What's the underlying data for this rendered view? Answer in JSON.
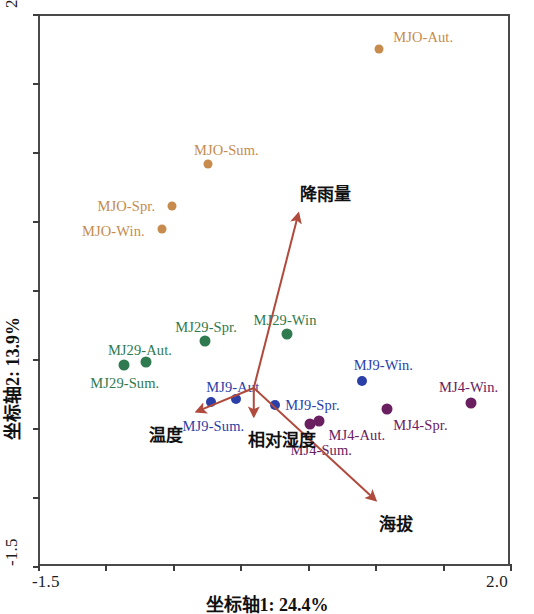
{
  "chart_data": {
    "type": "scatter",
    "title": "",
    "xlabel": "坐标轴1: 24.4%",
    "ylabel": "坐标轴2: 13.9%",
    "xlim": [
      -1.5,
      2.0
    ],
    "ylim": [
      -1.5,
      2.5
    ],
    "xticks": [
      -1.5,
      -1.0,
      -0.5,
      0.0,
      0.5,
      1.0,
      1.5,
      2.0
    ],
    "yticks": [
      -1.5,
      -1.0,
      -0.5,
      0.0,
      0.5,
      1.0,
      1.5,
      2.0,
      2.5
    ],
    "xtick_labels_shown": [
      "-1.5",
      "2.0"
    ],
    "ytick_labels_shown": [
      "-1.5",
      "2.5"
    ],
    "grid": false,
    "legend": "none",
    "colors": {
      "MJO": "#c68b4d",
      "MJ29": "#2f7a4e",
      "MJ9": "#2b3fa8",
      "MJ4": "#6a2060",
      "vector": "#b04a3c",
      "axis": "#4a4a4a"
    },
    "series": [
      {
        "name": "MJO",
        "color": "#c68b4d",
        "points": [
          {
            "label": "MJO-Aut.",
            "x": 1.03,
            "y": 2.25
          },
          {
            "label": "MJO-Sum.",
            "x": -0.24,
            "y": 1.41
          },
          {
            "label": "MJO-Spr.",
            "x": -0.51,
            "y": 1.11
          },
          {
            "label": "MJO-Win.",
            "x": -0.58,
            "y": 0.94
          }
        ]
      },
      {
        "name": "MJ29",
        "color": "#2f7a4e",
        "points": [
          {
            "label": "MJ29-Win",
            "x": 0.35,
            "y": 0.18
          },
          {
            "label": "MJ29-Spr.",
            "x": -0.26,
            "y": 0.13
          },
          {
            "label": "MJ29-Aut.",
            "x": -0.7,
            "y": -0.02
          },
          {
            "label": "MJ29-Sum.",
            "x": -0.86,
            "y": -0.04
          }
        ]
      },
      {
        "name": "MJ9",
        "color": "#2b3fa8",
        "points": [
          {
            "label": "MJ9-Win.",
            "x": 0.9,
            "y": -0.16
          },
          {
            "label": "MJ9-Spr.",
            "x": 0.26,
            "y": -0.33
          },
          {
            "label": "MJ9-Aut",
            "x": -0.03,
            "y": -0.29
          },
          {
            "label": "MJ9-Sum.",
            "x": -0.22,
            "y": -0.31
          }
        ]
      },
      {
        "name": "MJ4",
        "color": "#6a2060",
        "points": [
          {
            "label": "MJ4-Win.",
            "x": 1.71,
            "y": -0.32
          },
          {
            "label": "MJ4-Spr.",
            "x": 1.09,
            "y": -0.36
          },
          {
            "label": "MJ4-Aut.",
            "x": 0.58,
            "y": -0.45
          },
          {
            "label": "MJ4-Sum.",
            "x": 0.52,
            "y": -0.47
          }
        ]
      }
    ],
    "vectors": [
      {
        "label": "降雨量",
        "x0": 0.1,
        "y0": -0.21,
        "x1": 0.43,
        "y1": 1.05
      },
      {
        "label": "温度",
        "x0": 0.1,
        "y0": -0.21,
        "x1": -0.32,
        "y1": -0.38
      },
      {
        "label": "相对湿度",
        "x0": 0.1,
        "y0": -0.21,
        "x1": 0.1,
        "y1": -0.41
      },
      {
        "label": "海拔",
        "x0": 0.1,
        "y0": -0.21,
        "x1": 1.0,
        "y1": -1.02
      }
    ]
  }
}
